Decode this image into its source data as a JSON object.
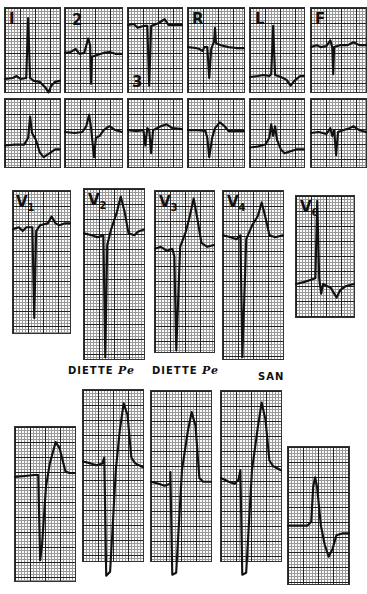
{
  "figure": {
    "rows": [
      {
        "name": "limb-leads-row-1",
        "panels": [
          {
            "id": "I",
            "label": "I",
            "label_pos": "top-left"
          },
          {
            "id": "2",
            "label": "2",
            "label_pos": "top-left"
          },
          {
            "id": "3",
            "label": "3",
            "label_pos": "bottom-left"
          },
          {
            "id": "R",
            "label": "R",
            "label_pos": "top-left"
          },
          {
            "id": "L",
            "label": "L",
            "label_pos": "top-left"
          },
          {
            "id": "F",
            "label": "F",
            "label_pos": "top-left"
          }
        ]
      },
      {
        "name": "limb-leads-row-2",
        "panels": [
          {
            "id": "I-b",
            "label": ""
          },
          {
            "id": "2-b",
            "label": ""
          },
          {
            "id": "3-b",
            "label": ""
          },
          {
            "id": "R-b",
            "label": ""
          },
          {
            "id": "L-b",
            "label": ""
          },
          {
            "id": "F-b",
            "label": ""
          }
        ]
      },
      {
        "name": "precordial-leads-row-1",
        "panels": [
          {
            "id": "V1",
            "label": "V",
            "sub": "1"
          },
          {
            "id": "V2",
            "label": "V",
            "sub": "2"
          },
          {
            "id": "V3",
            "label": "V",
            "sub": "3"
          },
          {
            "id": "V4",
            "label": "V",
            "sub": "4"
          },
          {
            "id": "V6",
            "label": "V",
            "sub": "6"
          }
        ]
      },
      {
        "name": "precordial-leads-row-2",
        "panels": [
          {
            "id": "P1",
            "label": ""
          },
          {
            "id": "P2",
            "label": ""
          },
          {
            "id": "P3",
            "label": ""
          },
          {
            "id": "P4",
            "label": ""
          },
          {
            "id": "P5",
            "label": ""
          }
        ]
      }
    ],
    "captions": [
      {
        "text": "DIETTE",
        "script": "Pe"
      },
      {
        "text": "DIETTE",
        "script": "Pe"
      },
      {
        "text": "SAN",
        "script": ""
      }
    ]
  }
}
